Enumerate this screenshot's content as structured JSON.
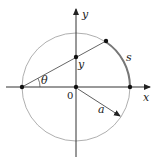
{
  "diagram": {
    "labels": {
      "x_axis": "x",
      "y_axis": "y",
      "origin": "0",
      "theta": "θ",
      "y_point": "y",
      "arc": "s",
      "radius": "a"
    },
    "colors": {
      "circle": "#888888",
      "axes": "#333333",
      "chord": "#666666",
      "arc_highlight": "#777777",
      "points": "#111111"
    }
  }
}
